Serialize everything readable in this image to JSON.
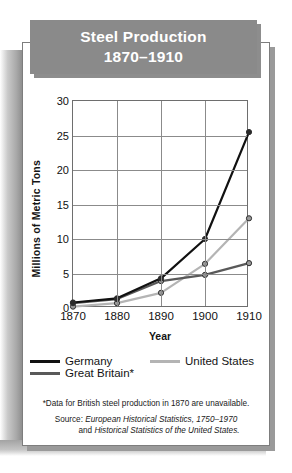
{
  "title": {
    "line1": "Steel Production",
    "line2": "1870–1910"
  },
  "chart_data": {
    "type": "line",
    "title": "Steel Production 1870–1910",
    "xlabel": "Year",
    "ylabel": "Millions of Metric Tons",
    "x": [
      1870,
      1880,
      1890,
      1900,
      1910
    ],
    "xticklabels": [
      "1870",
      "1880",
      "1890",
      "1900",
      "1910"
    ],
    "yticklabels": [
      "0",
      "5",
      "10",
      "15",
      "20",
      "25",
      "30"
    ],
    "yticks": [
      0,
      5,
      10,
      15,
      20,
      25,
      30
    ],
    "ylim": [
      0,
      30
    ],
    "xlim": [
      1870,
      1910
    ],
    "grid": true,
    "legend_position": "bottom",
    "markers": "circle",
    "series": [
      {
        "name": "Germany",
        "color": "#111111",
        "values": [
          0.8,
          1.4,
          4.3,
          10.0,
          25.5
        ]
      },
      {
        "name": "Great Britain*",
        "color": "#595959",
        "values": [
          0.7,
          1.3,
          3.9,
          4.8,
          6.5
        ]
      },
      {
        "name": "United States",
        "color": "#b4b4b4",
        "values": [
          0.2,
          0.7,
          2.2,
          6.4,
          13.0
        ]
      }
    ]
  },
  "legend": [
    {
      "label": "Germany",
      "color": "#111111"
    },
    {
      "label": "United States",
      "color": "#b4b4b4"
    },
    {
      "label": "Great Britain*",
      "color": "#595959"
    }
  ],
  "notes": {
    "footnote": "*Data for British steel production in 1870 are unavailable.",
    "source_prefix": "Source: ",
    "source_italic_1": "European Historical Statistics, 1750–1970",
    "source_and": "and ",
    "source_italic_2": "Historical Statistics of the United States."
  }
}
